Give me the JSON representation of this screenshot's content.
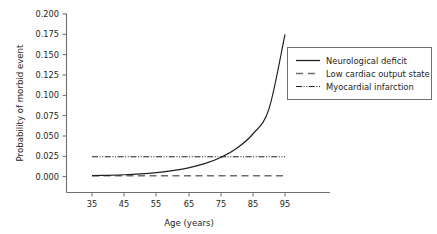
{
  "chart_data": {
    "type": "line",
    "title": "",
    "xlabel": "Age (years)",
    "ylabel": "Probability of morbid event",
    "xlim": [
      30,
      100
    ],
    "ylim": [
      0.0,
      0.2
    ],
    "xticks": [
      35,
      45,
      55,
      65,
      75,
      85,
      95
    ],
    "xtick_labels": [
      "35",
      "45",
      "55",
      "65",
      "75",
      "85",
      "95"
    ],
    "yticks": [
      0.0,
      0.025,
      0.05,
      0.075,
      0.1,
      0.125,
      0.15,
      0.175,
      0.2
    ],
    "ytick_labels": [
      "0.000",
      "0.025",
      "0.050",
      "0.075",
      "0.100",
      "0.125",
      "0.150",
      "0.175",
      "0.200"
    ],
    "grid": false,
    "legend_position": "upper right",
    "x": [
      35,
      40,
      45,
      50,
      55,
      60,
      65,
      70,
      75,
      80,
      85,
      90,
      95
    ],
    "series": [
      {
        "name": "Neurological deficit",
        "style": "solid",
        "color": "#231f20",
        "values": [
          0.0011,
          0.0016,
          0.0023,
          0.0034,
          0.005,
          0.0073,
          0.0108,
          0.0159,
          0.0235,
          0.0348,
          0.0524,
          0.083,
          0.175
        ]
      },
      {
        "name": "Low cardiac output state",
        "style": "dashed",
        "color": "#6d6e71",
        "values": [
          0.0011,
          0.0011,
          0.0011,
          0.0011,
          0.0011,
          0.0011,
          0.0011,
          0.0011,
          0.0011,
          0.0011,
          0.0011,
          0.0011,
          0.0011
        ]
      },
      {
        "name": "Myocardial infarction",
        "style": "dashdotdot",
        "color": "#231f20",
        "values": [
          0.0245,
          0.0245,
          0.0245,
          0.0245,
          0.0245,
          0.0245,
          0.0245,
          0.0245,
          0.0245,
          0.0245,
          0.0245,
          0.0245,
          0.0245
        ]
      }
    ]
  },
  "axes": {
    "y_label": "Probability of morbid event",
    "x_label": "Age (years)",
    "y_tick_0": "0.000",
    "y_tick_1": "0.025",
    "y_tick_2": "0.050",
    "y_tick_3": "0.075",
    "y_tick_4": "0.100",
    "y_tick_5": "0.125",
    "y_tick_6": "0.150",
    "y_tick_7": "0.175",
    "y_tick_8": "0.200",
    "x_tick_0": "35",
    "x_tick_1": "45",
    "x_tick_2": "55",
    "x_tick_3": "65",
    "x_tick_4": "75",
    "x_tick_5": "85",
    "x_tick_6": "95"
  },
  "legend": {
    "entry_0": "Neurological deficit",
    "entry_1": "Low cardiac output state",
    "entry_2": "Myocardial infarction"
  }
}
